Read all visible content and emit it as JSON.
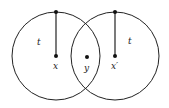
{
  "diagram": {
    "type": "overlapping-circles",
    "stroke_color": "#222222",
    "background": "#ffffff",
    "circles": [
      {
        "id": "left",
        "cx": 56,
        "cy": 56,
        "r": 44,
        "radius_label": "t",
        "center_label": "x"
      },
      {
        "id": "right",
        "cx": 115,
        "cy": 56,
        "r": 44,
        "radius_label": "t",
        "center_label": "x′"
      }
    ],
    "points": [
      {
        "id": "x",
        "cx": 56,
        "cy": 56,
        "label": "x"
      },
      {
        "id": "y",
        "cx": 87,
        "cy": 57,
        "label": "y"
      },
      {
        "id": "x-prime",
        "cx": 115,
        "cy": 56,
        "label": "x′"
      }
    ],
    "labels": {
      "left_radius": "t",
      "right_radius": "t",
      "x": "x",
      "y": "y",
      "x_prime": "x′"
    }
  }
}
